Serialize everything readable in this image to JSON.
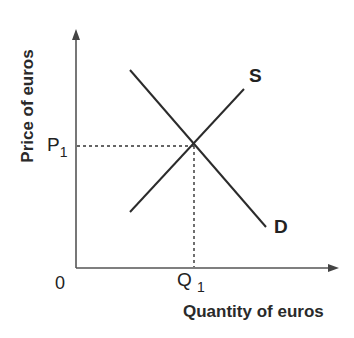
{
  "diagram": {
    "y_axis_label": "Price of euros",
    "x_axis_label": "Quantity of euros",
    "origin_label": "0",
    "price_label": {
      "base": "P",
      "sub": "1"
    },
    "quantity_label": {
      "base": "Q",
      "sub": "1"
    },
    "supply_label": "S",
    "demand_label": "D",
    "line_color": "#2b2b2b",
    "axis_color": "#555555",
    "equilibrium": {
      "price": "P1",
      "quantity": "Q1"
    }
  }
}
